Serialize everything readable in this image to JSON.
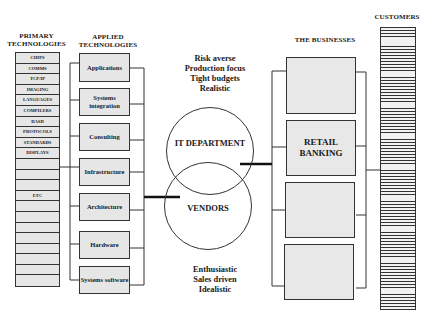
{
  "headings": {
    "primary": "PRIMARY TECHNOLOGIES",
    "applied": "APPLIED TECHNOLOGIES",
    "businesses": "THE BUSINESSES",
    "customers": "CUSTOMERS"
  },
  "primary_technologies": [
    "CHIPS",
    "COMMS",
    "TCP/IP",
    "IMAGING",
    "LANGUAGES",
    "COMPILERS",
    "DASD",
    "PROTOCOLS",
    "STANDARDS",
    "DISPLAYS",
    "",
    "",
    "",
    "ETC",
    "",
    "",
    "",
    "",
    "",
    "",
    "",
    "",
    ""
  ],
  "applied_technologies": [
    "Applications",
    "Systems integration",
    "Consulting",
    "Infrastructure",
    "Architecture",
    "Hardware",
    "Systems software"
  ],
  "it_department": {
    "label": "IT DEPARTMENT",
    "traits": [
      "Risk averse",
      "Production focus",
      "Tight budgets",
      "Realistic"
    ]
  },
  "vendors": {
    "label": "VENDORS",
    "traits": [
      "Enthusiastic",
      "Sales driven",
      "Idealistic"
    ]
  },
  "businesses": [
    "",
    "RETAIL BANKING",
    "",
    ""
  ],
  "colors": {
    "box_fill": "#e6e6e6",
    "line": "#333333",
    "background": "#ffffff"
  }
}
